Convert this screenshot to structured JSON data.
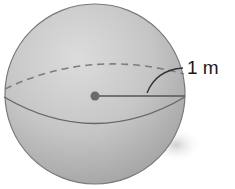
{
  "figure": {
    "type": "sphere-diagram",
    "radius_label": "1 m",
    "colors": {
      "sphere_fill_light": "#d9d9d9",
      "sphere_fill_mid": "#bdbdbd",
      "sphere_fill_dark": "#9e9e9e",
      "outline": "#777777",
      "line": "#555555",
      "center_dot": "#6b6b6b",
      "dashed_line": "#7d7d7d",
      "label_text": "#1a1a1a"
    },
    "elements": [
      {
        "name": "sphere",
        "shape": "circle"
      },
      {
        "name": "equator-front",
        "style": "solid"
      },
      {
        "name": "equator-back",
        "style": "dashed"
      },
      {
        "name": "center-point",
        "shape": "dot"
      },
      {
        "name": "radius-line",
        "style": "solid"
      },
      {
        "name": "leader-line",
        "style": "curved"
      }
    ]
  }
}
